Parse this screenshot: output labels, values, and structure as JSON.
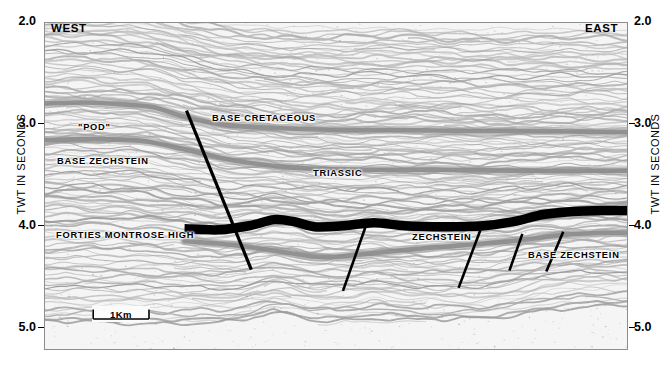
{
  "figure": {
    "type": "seismic-section",
    "background": "#ffffff"
  },
  "axes": {
    "left_title": "TWT IN SECONDS",
    "right_title": "TWT IN SECONDS",
    "unit": "seconds",
    "ticks": [
      "2.0",
      "3.0",
      "4.0",
      "5.0"
    ],
    "tick_values": [
      2.0,
      3.0,
      4.0,
      5.0
    ],
    "range": [
      2.0,
      5.2
    ]
  },
  "compass": {
    "west": "WEST",
    "east": "EAST"
  },
  "scalebar": {
    "label": "1Km",
    "color": "#000000"
  },
  "annotations": [
    {
      "id": "pod",
      "text": "\"POD\""
    },
    {
      "id": "base-cretaceous",
      "text": "BASE CRETACEOUS"
    },
    {
      "id": "base-zechstein-west",
      "text": "BASE ZECHSTEIN"
    },
    {
      "id": "triassic",
      "text": "TRIASSIC"
    },
    {
      "id": "forties-montrose-high",
      "text": "FORTIES MONTROSE HIGH"
    },
    {
      "id": "zechstein",
      "text": "ZECHSTEIN"
    },
    {
      "id": "base-zechstein-east",
      "text": "BASE ZECHSTEIN"
    }
  ],
  "colors": {
    "trace": "#8c8c8c",
    "horizon_grey": "#8a8a8a",
    "top_zechstein": "#000000",
    "fault": "#000000",
    "frame": "#8d8d8d",
    "panel_bg": "#f4f4f4"
  },
  "chart_data": {
    "type": "line",
    "title": "",
    "xlabel": "",
    "ylabel": "TWT IN SECONDS",
    "ylim": [
      2.0,
      5.2
    ],
    "xlim": [
      0,
      584
    ],
    "grid": false,
    "legend": "none",
    "series": [
      {
        "name": "Base Cretaceous",
        "style": "grey-band",
        "points": [
          [
            0,
            2.79
          ],
          [
            40,
            2.78
          ],
          [
            80,
            2.8
          ],
          [
            110,
            2.83
          ],
          [
            140,
            2.92
          ],
          [
            180,
            3.0
          ],
          [
            230,
            3.03
          ],
          [
            300,
            3.05
          ],
          [
            360,
            3.05
          ],
          [
            430,
            3.06
          ],
          [
            500,
            3.06
          ],
          [
            560,
            3.07
          ],
          [
            584,
            3.07
          ]
        ]
      },
      {
        "name": "Base Zechstein (west flank)",
        "style": "grey-band",
        "points": [
          [
            0,
            3.15
          ],
          [
            50,
            3.14
          ],
          [
            100,
            3.16
          ],
          [
            140,
            3.24
          ],
          [
            190,
            3.35
          ],
          [
            250,
            3.42
          ],
          [
            320,
            3.44
          ],
          [
            400,
            3.44
          ],
          [
            470,
            3.45
          ],
          [
            540,
            3.45
          ],
          [
            584,
            3.45
          ]
        ]
      },
      {
        "name": "Top Zechstein (salt)",
        "style": "thick-black",
        "points": [
          [
            140,
            4.02
          ],
          [
            175,
            4.03
          ],
          [
            205,
            3.99
          ],
          [
            230,
            3.93
          ],
          [
            250,
            3.95
          ],
          [
            270,
            4.0
          ],
          [
            300,
            3.99
          ],
          [
            330,
            3.96
          ],
          [
            360,
            3.99
          ],
          [
            400,
            4.0
          ],
          [
            440,
            3.99
          ],
          [
            470,
            3.95
          ],
          [
            500,
            3.88
          ],
          [
            530,
            3.85
          ],
          [
            560,
            3.84
          ],
          [
            584,
            3.84
          ]
        ]
      },
      {
        "name": "Base Zechstein (east flank)",
        "style": "grey-band",
        "points": [
          [
            140,
            4.14
          ],
          [
            190,
            4.18
          ],
          [
            240,
            4.25
          ],
          [
            280,
            4.3
          ],
          [
            320,
            4.27
          ],
          [
            370,
            4.22
          ],
          [
            420,
            4.18
          ],
          [
            470,
            4.14
          ],
          [
            520,
            4.08
          ],
          [
            560,
            4.06
          ],
          [
            584,
            4.06
          ]
        ]
      }
    ],
    "faults": [
      {
        "id": "main-fault",
        "x1": 142,
        "y1": 2.86,
        "x2": 207,
        "y2": 4.42
      },
      {
        "id": "fault-2",
        "x1": 322,
        "y1": 3.99,
        "x2": 299,
        "y2": 4.63
      },
      {
        "id": "fault-3",
        "x1": 437,
        "y1": 4.03,
        "x2": 415,
        "y2": 4.6
      },
      {
        "id": "fault-4",
        "x1": 479,
        "y1": 4.07,
        "x2": 466,
        "y2": 4.43
      },
      {
        "id": "fault-5",
        "x1": 520,
        "y1": 4.05,
        "x2": 503,
        "y2": 4.44
      }
    ]
  }
}
